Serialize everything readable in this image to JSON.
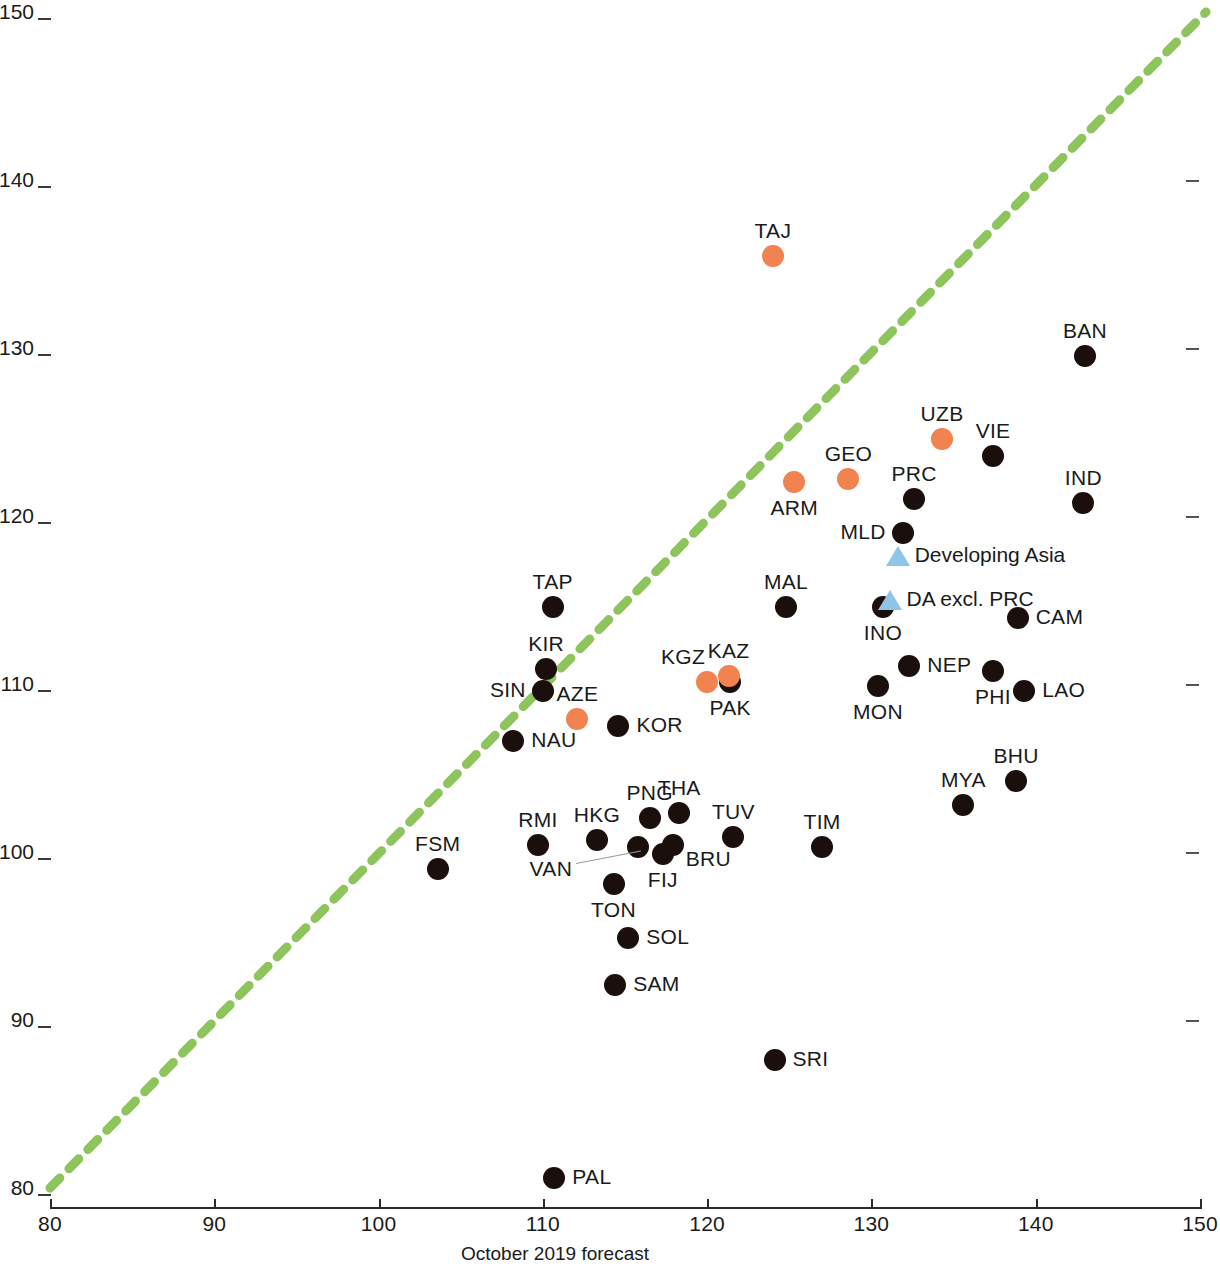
{
  "chart_data": {
    "type": "scatter",
    "title": "",
    "xlabel": "October 2019 forecast",
    "ylabel": "",
    "xlim": [
      80,
      150
    ],
    "ylim": [
      80,
      150
    ],
    "xticks": [
      80,
      90,
      100,
      110,
      120,
      130,
      140,
      150
    ],
    "yticks": [
      80,
      90,
      100,
      110,
      120,
      130,
      140,
      150
    ],
    "grid": false,
    "legend_position": "inside-right",
    "reference_line": {
      "name": "45-degree parity line",
      "style": "dashed",
      "color": "#8ec45c",
      "from": [
        80,
        80
      ],
      "to": [
        150,
        150
      ]
    },
    "series": [
      {
        "name": "Economies",
        "marker": "circle",
        "color": "#1a0f0c",
        "points": [
          {
            "label": "BAN",
            "x": 143.0,
            "y": 129.5,
            "label_pos": "top"
          },
          {
            "label": "VIE",
            "x": 137.4,
            "y": 123.6,
            "label_pos": "top"
          },
          {
            "label": "PRC",
            "x": 132.6,
            "y": 121.0,
            "label_pos": "top"
          },
          {
            "label": "IND",
            "x": 142.9,
            "y": 120.8,
            "label_pos": "top"
          },
          {
            "label": "MLD",
            "x": 131.9,
            "y": 119.0,
            "label_pos": "left"
          },
          {
            "label": "MAL",
            "x": 124.8,
            "y": 114.6,
            "label_pos": "top"
          },
          {
            "label": "INO",
            "x": 130.7,
            "y": 114.6,
            "label_pos": "bottom"
          },
          {
            "label": "CAM",
            "x": 138.9,
            "y": 113.9,
            "label_pos": "right"
          },
          {
            "label": "TAP",
            "x": 110.6,
            "y": 114.6,
            "label_pos": "top"
          },
          {
            "label": "KIR",
            "x": 110.2,
            "y": 110.9,
            "label_pos": "top"
          },
          {
            "label": "NEP",
            "x": 132.3,
            "y": 111.1,
            "label_pos": "right"
          },
          {
            "label": "PHI",
            "x": 137.4,
            "y": 110.8,
            "label_pos": "bottom"
          },
          {
            "label": "PAK",
            "x": 121.4,
            "y": 110.1,
            "label_pos": "bottom"
          },
          {
            "label": "SIN",
            "x": 110.0,
            "y": 109.6,
            "label_pos": "left"
          },
          {
            "label": "MON",
            "x": 130.4,
            "y": 109.9,
            "label_pos": "bottom"
          },
          {
            "label": "LAO",
            "x": 139.3,
            "y": 109.6,
            "label_pos": "right"
          },
          {
            "label": "KOR",
            "x": 114.6,
            "y": 107.5,
            "label_pos": "right"
          },
          {
            "label": "NAU",
            "x": 108.2,
            "y": 106.6,
            "label_pos": "right"
          },
          {
            "label": "BHU",
            "x": 138.8,
            "y": 104.2,
            "label_pos": "top"
          },
          {
            "label": "MYA",
            "x": 135.6,
            "y": 102.8,
            "label_pos": "top"
          },
          {
            "label": "THA",
            "x": 118.3,
            "y": 102.3,
            "label_pos": "top"
          },
          {
            "label": "PNG",
            "x": 116.5,
            "y": 102.0,
            "label_pos": "top"
          },
          {
            "label": "TUV",
            "x": 121.6,
            "y": 100.9,
            "label_pos": "top"
          },
          {
            "label": "HKG",
            "x": 113.3,
            "y": 100.7,
            "label_pos": "top"
          },
          {
            "label": "RMI",
            "x": 109.7,
            "y": 100.4,
            "label_pos": "top"
          },
          {
            "label": "TIM",
            "x": 127.0,
            "y": 100.3,
            "label_pos": "top"
          },
          {
            "label": "BRU",
            "x": 117.9,
            "y": 100.4,
            "label_pos": "bottomright"
          },
          {
            "label": "FIJ",
            "x": 117.3,
            "y": 99.9,
            "label_pos": "bottom"
          },
          {
            "label": "VAN",
            "x": 115.8,
            "y": 100.3,
            "label_pos": "leader"
          },
          {
            "label": "FSM",
            "x": 103.6,
            "y": 99.0,
            "label_pos": "top"
          },
          {
            "label": "TON",
            "x": 114.3,
            "y": 98.1,
            "label_pos": "bottom"
          },
          {
            "label": "SOL",
            "x": 115.2,
            "y": 94.9,
            "label_pos": "right"
          },
          {
            "label": "SAM",
            "x": 114.4,
            "y": 92.1,
            "label_pos": "right"
          },
          {
            "label": "SRI",
            "x": 124.1,
            "y": 87.6,
            "label_pos": "right"
          },
          {
            "label": "PAL",
            "x": 110.7,
            "y": 80.6,
            "label_pos": "right"
          }
        ]
      },
      {
        "name": "Highlighted economies",
        "marker": "circle",
        "color": "#f0834f",
        "points": [
          {
            "label": "TAJ",
            "x": 124.0,
            "y": 135.5,
            "label_pos": "top"
          },
          {
            "label": "UZB",
            "x": 134.3,
            "y": 124.6,
            "label_pos": "top"
          },
          {
            "label": "GEO",
            "x": 128.6,
            "y": 122.2,
            "label_pos": "top"
          },
          {
            "label": "ARM",
            "x": 125.3,
            "y": 122.0,
            "label_pos": "bottom"
          },
          {
            "label": "KAZ",
            "x": 121.3,
            "y": 110.5,
            "label_pos": "top"
          },
          {
            "label": "KGZ",
            "x": 120.0,
            "y": 110.1,
            "label_pos": "topleft"
          },
          {
            "label": "AZE",
            "x": 112.1,
            "y": 107.9,
            "label_pos": "top"
          }
        ]
      }
    ],
    "aggregate_markers": [
      {
        "label": "Developing Asia",
        "x": 131.6,
        "y": 117.6,
        "marker": "triangle",
        "color": "#8ec6e8"
      },
      {
        "label": "DA excl. PRC",
        "x": 131.1,
        "y": 115.0,
        "marker": "triangle",
        "color": "#8ec6e8"
      }
    ]
  },
  "axes": {
    "x_title": "October 2019 forecast",
    "x_tick_labels": [
      "80",
      "90",
      "100",
      "110",
      "120",
      "130",
      "140",
      "150"
    ],
    "y_tick_labels": [
      "80",
      "90",
      "100",
      "110",
      "120",
      "130",
      "140",
      "150"
    ]
  },
  "colors": {
    "black_marker": "#1a0f0c",
    "orange_marker": "#f0834f",
    "blue_triangle": "#8ec6e8",
    "green_line": "#8ec45c",
    "axis": "#2b2b2b"
  }
}
